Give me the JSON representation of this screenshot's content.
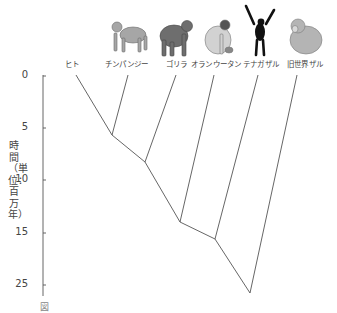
{
  "diagram": {
    "type": "phylogenetic-tree",
    "taxa": [
      {
        "label": "ヒト",
        "x": 72,
        "illustration": "none"
      },
      {
        "label": "チンパンジー",
        "x": 128,
        "illustration": "chimpanzee"
      },
      {
        "label": "ゴリラ",
        "x": 176,
        "illustration": "gorilla"
      },
      {
        "label": "オランウータン",
        "x": 214,
        "illustration": "orangutan"
      },
      {
        "label": "テナガザル",
        "x": 258,
        "illustration": "gibbon"
      },
      {
        "label": "旧世界ザル",
        "x": 297,
        "illustration": "old-world-monkey"
      }
    ],
    "axis": {
      "label": "時間（単位：百万年）",
      "ticks": [
        "0",
        "5",
        "10",
        "15",
        "25"
      ]
    },
    "divergence_nodes_mya": [
      {
        "joins": [
          "ヒト",
          "チンパンジー"
        ],
        "approx": 5.7
      },
      {
        "joins": [
          "ゴリラ"
        ],
        "approx": 8.3
      },
      {
        "joins": [
          "オランウータン"
        ],
        "approx": 14
      },
      {
        "joins": [
          "テナガザル"
        ],
        "approx": 15.6
      },
      {
        "joins": [
          "旧世界ザル"
        ],
        "approx": 25.5
      }
    ]
  },
  "caption": "図"
}
